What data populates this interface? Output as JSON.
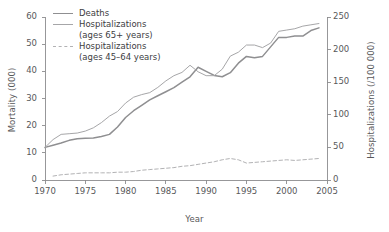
{
  "chart_data": {
    "type": "line",
    "title": "",
    "xlabel": "Year",
    "ylabel": "Mortality (000)",
    "ylabel_right": "Hospitalizations (/100 000)",
    "xlim": [
      1970,
      2005
    ],
    "ylim": [
      0,
      60
    ],
    "ylim_right": [
      0,
      250
    ],
    "xticks": [
      1970,
      1975,
      1980,
      1985,
      1990,
      1995,
      2000,
      2005
    ],
    "yticks_left": [
      0,
      10,
      20,
      30,
      40,
      50,
      60
    ],
    "yticks_right": [
      0,
      50,
      100,
      150,
      200,
      250
    ],
    "grid": false,
    "legend_position": "top-left",
    "series": [
      {
        "name": "Deaths",
        "axis": "left",
        "style": "solid",
        "color": "#8f8f91",
        "x": [
          1970,
          1971,
          1972,
          1973,
          1974,
          1975,
          1976,
          1977,
          1978,
          1979,
          1980,
          1981,
          1982,
          1983,
          1984,
          1985,
          1986,
          1987,
          1988,
          1989,
          1990,
          1991,
          1992,
          1993,
          1994,
          1995,
          1996,
          1997,
          1998,
          1999,
          2000,
          2001,
          2002,
          2003,
          2004
        ],
        "values": [
          12.0,
          12.8,
          13.6,
          14.6,
          15.2,
          15.4,
          15.5,
          16.0,
          16.8,
          19.5,
          23.0,
          25.5,
          27.5,
          29.5,
          31.0,
          32.5,
          34.0,
          36.0,
          38.0,
          41.5,
          40.0,
          38.5,
          38.0,
          39.5,
          43.0,
          45.5,
          45.0,
          45.5,
          49.0,
          52.5,
          52.5,
          53.0,
          53.0,
          55.0,
          56.0
        ]
      },
      {
        "name": "Hospitalizations (ages 65+ years)",
        "axis": "right",
        "style": "solid",
        "color": "#a6a6a8",
        "x": [
          1970,
          1971,
          1972,
          1973,
          1974,
          1975,
          1976,
          1977,
          1978,
          1979,
          1980,
          1981,
          1982,
          1983,
          1984,
          1985,
          1986,
          1987,
          1988,
          1989,
          1990,
          1991,
          1992,
          1993,
          1994,
          1995,
          1996,
          1997,
          1998,
          1999,
          2000,
          2001,
          2002,
          2003,
          2004
        ],
        "values": [
          50,
          62,
          70,
          71,
          72,
          75,
          80,
          88,
          98,
          105,
          118,
          127,
          131,
          134,
          142,
          152,
          160,
          165,
          176,
          166,
          160,
          160,
          170,
          190,
          196,
          207,
          207,
          203,
          210,
          228,
          230,
          232,
          236,
          238,
          240
        ]
      },
      {
        "name": "Hospitalizations (ages 45–64 years)",
        "axis": "right",
        "style": "dashed",
        "color": "#b2b2b4",
        "x": [
          1971,
          1972,
          1973,
          1974,
          1975,
          1976,
          1977,
          1978,
          1979,
          1980,
          1981,
          1982,
          1983,
          1984,
          1985,
          1986,
          1987,
          1988,
          1989,
          1990,
          1991,
          1992,
          1993,
          1994,
          1995,
          1996,
          1997,
          1998,
          1999,
          2000,
          2001,
          2002,
          2003,
          2004
        ],
        "values": [
          6,
          8,
          9,
          10,
          11,
          11,
          11,
          11,
          12,
          12,
          13,
          15,
          16,
          17,
          18,
          19,
          21,
          22,
          24,
          26,
          28,
          31,
          33,
          31,
          26,
          27,
          28,
          29,
          30,
          31,
          30,
          31,
          32,
          33
        ]
      }
    ]
  },
  "legend": {
    "items": [
      {
        "label": "Deaths",
        "sub": ""
      },
      {
        "label": "Hospitalizations",
        "sub": "(ages 65+ years)"
      },
      {
        "label": "Hospitalizations",
        "sub": "(ages 45–64 years)"
      }
    ]
  },
  "axes": {
    "x_title": "Year",
    "y_left_title": "Mortality (000)",
    "y_right_title": "Hospitalizations (/100 000)",
    "x_tick_labels": [
      "1970",
      "1975",
      "1980",
      "1985",
      "1990",
      "1995",
      "2000",
      "2005"
    ],
    "y_left_tick_labels": [
      "0",
      "10",
      "20",
      "30",
      "40",
      "50",
      "60"
    ],
    "y_right_tick_labels": [
      "0",
      "50",
      "100",
      "150",
      "200",
      "250"
    ]
  },
  "colors": {
    "axis": "#8c8c8e",
    "text": "#58585a",
    "deaths": "#8f8f91",
    "hosp65": "#a6a6a8",
    "hosp45": "#b2b2b4"
  }
}
